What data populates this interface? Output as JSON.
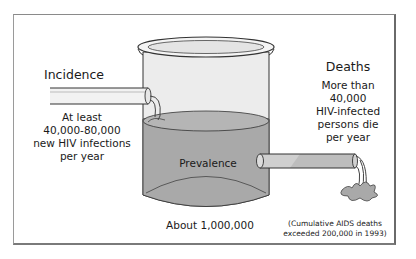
{
  "diagram": {
    "incidence": {
      "title": "Incidence",
      "lines": [
        "At least",
        "40,000-80,000",
        "new HIV infections",
        "per year"
      ]
    },
    "deaths": {
      "title": "Deaths",
      "lines": [
        "More than",
        "40,000",
        "HIV-infected",
        "persons die",
        "per year"
      ]
    },
    "prevalence": {
      "label": "Prevalence",
      "caption": "About 1,000,000"
    },
    "note": {
      "lines": [
        "(Cumulative AIDS deaths",
        "exceeded 200,000 in 1993)"
      ]
    },
    "colors": {
      "liquid": "#a9a9a9",
      "glass": "#e9e9e9",
      "outline": "#333333",
      "frame": "#7a7a7a"
    }
  }
}
